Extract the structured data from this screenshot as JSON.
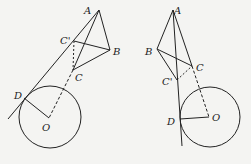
{
  "figures": [
    {
      "id": "left",
      "points": {
        "A": {
          "label": "A",
          "x": 99,
          "y": 10,
          "lx": 84,
          "ly": 14
        },
        "B": {
          "label": "B",
          "x": 110,
          "y": 50,
          "lx": 113,
          "ly": 55
        },
        "C_prime": {
          "label": "C'",
          "x": 74,
          "y": 41,
          "lx": 60,
          "ly": 44
        },
        "C": {
          "label": "C",
          "x": 73,
          "y": 70,
          "lx": 75,
          "ly": 81
        },
        "D": {
          "label": "D",
          "x": 24,
          "y": 98,
          "lx": 14,
          "ly": 99
        },
        "O": {
          "label": "O",
          "x": 49,
          "y": 118,
          "lx": 42,
          "ly": 131
        }
      },
      "circle": {
        "cx": 50,
        "cy": 117,
        "r": 31
      }
    },
    {
      "id": "right",
      "points": {
        "A": {
          "label": "A",
          "x": 173,
          "y": 10,
          "lx": 174,
          "ly": 14
        },
        "B": {
          "label": "B",
          "x": 157,
          "y": 49,
          "lx": 145,
          "ly": 55
        },
        "C": {
          "label": "C",
          "x": 192,
          "y": 66,
          "lx": 196,
          "ly": 71
        },
        "C_prime": {
          "label": "C'",
          "x": 177,
          "y": 80,
          "lx": 162,
          "ly": 85
        },
        "D": {
          "label": "D",
          "x": 180,
          "y": 119,
          "lx": 167,
          "ly": 125
        },
        "O": {
          "label": "O",
          "x": 209,
          "y": 117,
          "lx": 212,
          "ly": 121
        }
      },
      "circle": {
        "cx": 210,
        "cy": 117,
        "r": 30
      }
    }
  ],
  "colors": {
    "stroke": "#222222",
    "background": "#f4f4f2"
  }
}
